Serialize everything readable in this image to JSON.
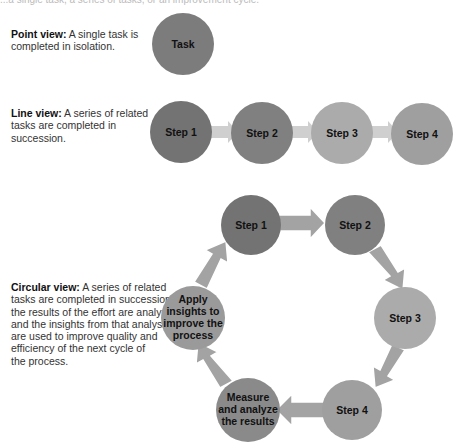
{
  "header": {
    "cut_off_text": "...a single task, a series of tasks, or an improvement cycle."
  },
  "views": {
    "point": {
      "title": "Point view:",
      "body": "A single task is completed in isolation.",
      "lines": [
        "A single task is",
        "completed in isolation."
      ],
      "nodes": [
        {
          "label": "Task",
          "color": "#7c7c7c"
        }
      ]
    },
    "line": {
      "title": "Line view:",
      "lines": [
        "A series of related",
        "tasks are completed in",
        "succession."
      ],
      "nodes": [
        {
          "label": "Step 1",
          "color": "#737373"
        },
        {
          "label": "Step 2",
          "color": "#808080"
        },
        {
          "label": "Step 3",
          "color": "#ababab"
        },
        {
          "label": "Step 4",
          "color": "#9f9f9f"
        }
      ],
      "arrow_color": "#cfcfcf"
    },
    "circular": {
      "title": "Circular view:",
      "lines": [
        "A series of related",
        "tasks are completed in succession,",
        "the results of the effort are analyzed,",
        "and the insights from that analysis",
        "are used to improve quality and",
        "efficiency of the next cycle of",
        "the process."
      ],
      "nodes": [
        {
          "label": "Step 1",
          "color": "#737373"
        },
        {
          "label": "Step 2",
          "color": "#808080"
        },
        {
          "label": "Step 3",
          "color": "#ababab"
        },
        {
          "label": "Step 4",
          "color": "#9f9f9f"
        },
        {
          "label_lines": [
            "Measure",
            "and analyze",
            "the results"
          ],
          "color": "#8a8a8a"
        },
        {
          "label_lines": [
            "Apply",
            "insights to",
            "improve the",
            "process"
          ],
          "color": "#9a9a9a"
        }
      ],
      "arrow_color": "#a3a3a3"
    }
  }
}
